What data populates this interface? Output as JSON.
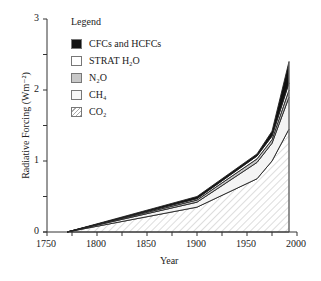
{
  "chart_data": {
    "type": "area",
    "stacked": true,
    "title": "",
    "xlabel": "Year",
    "ylabel": "Radiative Forcing (Wm⁻²)",
    "xlim": [
      1750,
      2000
    ],
    "ylim": [
      0,
      3
    ],
    "x_ticks": [
      1750,
      1800,
      1850,
      1900,
      1950,
      2000
    ],
    "y_ticks": [
      0,
      1,
      2,
      3
    ],
    "grid": false,
    "legend_position": "upper-left",
    "legend_title": "Legend",
    "x": [
      1770,
      1900,
      1960,
      1975,
      1992
    ],
    "series": [
      {
        "name": "CO₂",
        "fill": "hatch",
        "cumulative_top": [
          0,
          0.35,
          0.75,
          1.0,
          1.45
        ]
      },
      {
        "name": "CH₄",
        "fill": "#f4f4f4",
        "cumulative_top": [
          0,
          0.42,
          0.98,
          1.25,
          1.9
        ]
      },
      {
        "name": "N₂O",
        "fill": "#c8c8c8",
        "cumulative_top": [
          0,
          0.45,
          1.03,
          1.3,
          2.0
        ]
      },
      {
        "name": "STRAT H₂O",
        "fill": "#ffffff",
        "cumulative_top": [
          0,
          0.47,
          1.07,
          1.35,
          2.1
        ]
      },
      {
        "name": "CFCs and HCFCs",
        "fill": "#111111",
        "cumulative_top": [
          0,
          0.5,
          1.1,
          1.42,
          2.4
        ]
      }
    ]
  },
  "legend": {
    "title": "Legend",
    "items": [
      "CFCs and HCFCs",
      "STRAT H₂O",
      "N₂O",
      "CH₄",
      "CO₂"
    ]
  },
  "axes": {
    "xlabel": "Year",
    "ylabel": "Radiative Forcing (Wm⁻²)",
    "xticks": [
      "1750",
      "1800",
      "1850",
      "1900",
      "1950",
      "2000"
    ],
    "yticks": [
      "0",
      "1",
      "2",
      "3"
    ]
  }
}
